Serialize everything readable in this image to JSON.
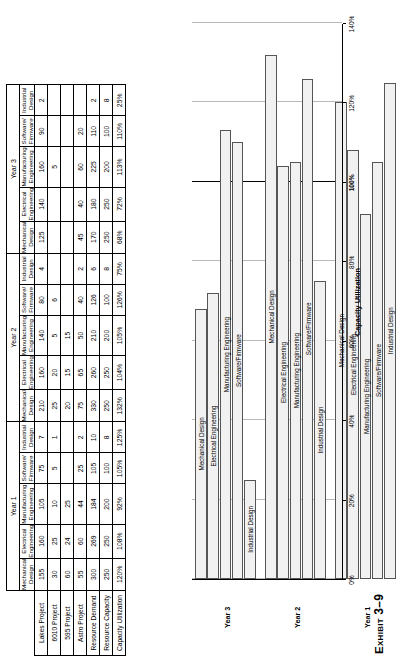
{
  "caption": {
    "prefix": "Exhibit",
    "number": "3–9"
  },
  "table": {
    "row_header_label": "",
    "row_labels": [
      "Lakes Project",
      "6010 Project",
      "595 Project",
      "Astro Project",
      "Resource Demand",
      "Resource Capacity",
      "Capacity Utilization"
    ],
    "disciplines": [
      "Mechanical Design",
      "Electrical Engineering",
      "Manufacturing Engineering",
      "Software/ Firmware",
      "Industrial Design"
    ],
    "disciplines_l1": [
      "Mechanical",
      "Electrical",
      "Manufacturing",
      "Software/",
      "Industrial"
    ],
    "disciplines_l2": [
      "Design",
      "Engineering",
      "Engineering",
      "Firmware",
      "Design"
    ],
    "years": [
      "Year 1",
      "Year 2",
      "Year 3"
    ],
    "year1": {
      "label": "Year 1",
      "rows": [
        [
          "155",
          "160",
          "105",
          "75",
          "7"
        ],
        [
          "30",
          "25",
          "10",
          "5",
          "1"
        ],
        [
          "60",
          "24",
          "25",
          "",
          ""
        ],
        [
          "55",
          "60",
          "44",
          "25",
          "2"
        ],
        [
          "300",
          "269",
          "184",
          "105",
          "10"
        ],
        [
          "250",
          "250",
          "200",
          "100",
          "8"
        ],
        [
          "120%",
          "108%",
          "92%",
          "105%",
          "125%"
        ]
      ]
    },
    "year2": {
      "label": "Year 2",
      "rows": [
        [
          "210",
          "160",
          "140",
          "80",
          "4"
        ],
        [
          "25",
          "20",
          "5",
          "6",
          ""
        ],
        [
          "20",
          "15",
          "15",
          "",
          ""
        ],
        [
          "75",
          "65",
          "50",
          "40",
          "2"
        ],
        [
          "330",
          "260",
          "210",
          "126",
          "6"
        ],
        [
          "250",
          "250",
          "200",
          "100",
          "8"
        ],
        [
          "132%",
          "104%",
          "105%",
          "126%",
          "75%"
        ]
      ]
    },
    "year3": {
      "label": "Year 3",
      "rows": [
        [
          "125",
          "140",
          "160",
          "90",
          "2"
        ],
        [
          "",
          "",
          "5",
          "",
          ""
        ],
        [
          "",
          "",
          "",
          "",
          ""
        ],
        [
          "45",
          "40",
          "60",
          "20",
          ""
        ],
        [
          "170",
          "180",
          "225",
          "110",
          "2"
        ],
        [
          "250",
          "250",
          "200",
          "100",
          "8"
        ],
        [
          "68%",
          "72%",
          "113%",
          "110%",
          "25%"
        ]
      ]
    }
  },
  "chart_data": {
    "type": "bar",
    "orientation": "vertical",
    "title": "",
    "xlabel": "",
    "ylabel": "Capacity Utilization",
    "ylim": [
      0,
      140
    ],
    "ytick_values": [
      0,
      20,
      40,
      60,
      80,
      100,
      120,
      140
    ],
    "ytick_labels": [
      "0%",
      "20%",
      "40%",
      "60%",
      "80%",
      "100%",
      "120%",
      "140%"
    ],
    "reference_line": 100,
    "grid": true,
    "legend": "none",
    "bar_color": "#f1f1f1",
    "bar_border_color": "#555555",
    "group_label_key": "Year",
    "groups": [
      {
        "name": "Year 1",
        "categories": [
          "Mechanical Design",
          "Electrical Engineering",
          "Manufacturing Engineering",
          "Software/Firmware",
          "Industrial Design"
        ],
        "values": [
          120,
          108,
          92,
          105,
          125
        ]
      },
      {
        "name": "Year 2",
        "categories": [
          "Mechanical Design",
          "Electrical Engineering",
          "Manufacturing Engineering",
          "Software/Firmware",
          "Industrial Design"
        ],
        "values": [
          132,
          104,
          105,
          126,
          75
        ]
      },
      {
        "name": "Year 3",
        "categories": [
          "Mechanical Design",
          "Electrical Engineering",
          "Manufacturing Engineering",
          "Software/Firmware",
          "Industrial Design"
        ],
        "values": [
          68,
          72,
          113,
          110,
          25
        ]
      }
    ]
  }
}
